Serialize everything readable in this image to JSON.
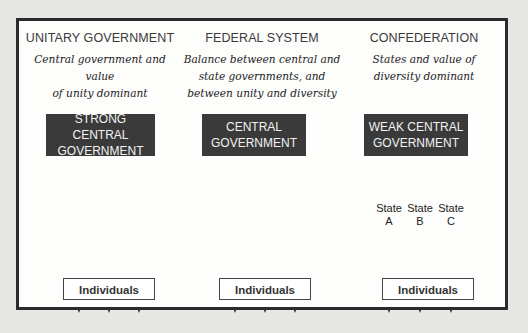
{
  "diagram": {
    "columns": [
      {
        "title": "UNITARY GOVERNMENT",
        "description_line1": "Central government and value",
        "description_line2": "of unity dominant",
        "gov_box_line1": "STRONG CENTRAL",
        "gov_box_line2": "GOVERNMENT",
        "bottom_box": "Individuals"
      },
      {
        "title": "FEDERAL SYSTEM",
        "description_line1": "Balance between central and",
        "description_line2": "state governments, and",
        "description_line3": "between unity and diversity",
        "gov_box_line1": "CENTRAL",
        "gov_box_line2": "GOVERNMENT",
        "bottom_box": "Individuals"
      },
      {
        "title": "CONFEDERATION",
        "description_line1": "States and value of",
        "description_line2": "diversity dominant",
        "gov_box_line1": "WEAK CENTRAL",
        "gov_box_line2": "GOVERNMENT",
        "bottom_box": "Individuals",
        "states": [
          {
            "line1": "State",
            "line2": "A"
          },
          {
            "line1": "State",
            "line2": "B"
          },
          {
            "line1": "State",
            "line2": "C"
          }
        ]
      }
    ],
    "colors": {
      "background": "#e6e6e4",
      "panel": "#fdfdfc",
      "border": "#2b2b2b",
      "gov_box": "#3a3a3a",
      "gov_text": "#f2f2f2"
    }
  }
}
